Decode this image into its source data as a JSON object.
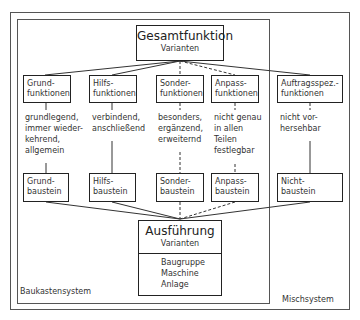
{
  "top": {
    "title": "Gesamtfunktion",
    "subtitle": "Varianten"
  },
  "functions": [
    {
      "line1": "Grund-",
      "line2": "funktionen"
    },
    {
      "line1": "Hilfs-",
      "line2": "funktionen"
    },
    {
      "line1": "Sonder-",
      "line2": "funktionen"
    },
    {
      "line1": "Anpass-",
      "line2": "funktionen"
    },
    {
      "line1": "Auftragsspez.-",
      "line2": "funktionen"
    }
  ],
  "descriptions": [
    [
      "grundlegend,",
      "immer wieder-",
      "kehrend,",
      "allgemein"
    ],
    [
      "verbindend,",
      "anschließend"
    ],
    [
      "besonders,",
      "ergänzend,",
      "erweiternd"
    ],
    [
      "nicht genau",
      "in allen",
      "Teilen",
      "festlegbar"
    ],
    [
      "nicht vor-",
      "hersehbar"
    ]
  ],
  "modules": [
    {
      "line1": "Grund-",
      "line2": "baustein"
    },
    {
      "line1": "Hilfs-",
      "line2": "baustein"
    },
    {
      "line1": "Sonder-",
      "line2": "baustein"
    },
    {
      "line1": "Anpass-",
      "line2": "baustein"
    },
    {
      "line1": "Nicht-",
      "line2": "baustein"
    }
  ],
  "bottom": {
    "title": "Ausführung",
    "subtitle": "Varianten",
    "items": [
      "Baugruppe",
      "Maschine",
      "Anlage"
    ]
  },
  "systems": {
    "inner": "Baukastensystem",
    "outer": "Mischsystem"
  }
}
